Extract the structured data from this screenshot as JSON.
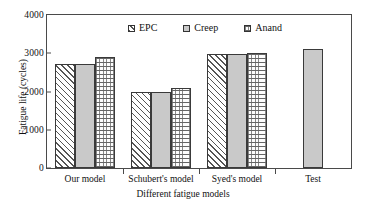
{
  "chart_data": {
    "type": "bar",
    "title": "",
    "xlabel": "Different fatigue models",
    "ylabel": "Fatigue life (cycles)",
    "categories": [
      "Our model",
      "Schubert's model",
      "Syed's model",
      "Test"
    ],
    "series": [
      {
        "name": "EPC",
        "values": [
          2720,
          2000,
          2980,
          null
        ],
        "pattern": "diagonal-hatch"
      },
      {
        "name": "Creep",
        "values": [
          2720,
          2000,
          2980,
          3100
        ],
        "pattern": "solid-grey"
      },
      {
        "name": "Anand",
        "values": [
          2900,
          2100,
          3010,
          null
        ],
        "pattern": "dashed-brick"
      }
    ],
    "ylim": [
      0,
      4000
    ],
    "yticks": [
      0,
      1000,
      2000,
      3000,
      4000
    ],
    "ytick_labels": [
      "0",
      "1000",
      "2000",
      "3000",
      "4000"
    ],
    "grid": false,
    "legend_position": "top-center",
    "legend_entries": [
      "EPC",
      "Creep",
      "Anand"
    ],
    "colors": {
      "bar_fill_solid": "#c9c9c9",
      "bar_edge": "#3a3a3a",
      "axis": "#4a4a4a",
      "background": "#ffffff",
      "text": "#111111"
    }
  }
}
